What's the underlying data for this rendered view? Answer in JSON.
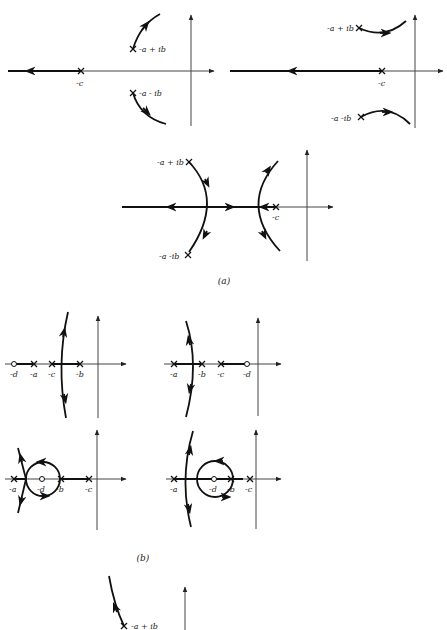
{
  "figure": {
    "captions": {
      "a": "(a)",
      "b": "(b)"
    },
    "part_a": {
      "plot1": {
        "labels": {
          "upper_pole": "-a + ib",
          "lower_pole": "-a - ib",
          "real_pole": "-c"
        }
      },
      "plot2": {
        "labels": {
          "upper_pole": "-a + ib",
          "lower_pole": "-a -ib",
          "real_pole": "-c"
        }
      },
      "plot3": {
        "labels": {
          "upper_pole": "-a + ib",
          "lower_pole": "-a -ib",
          "real_pole": "-c"
        }
      }
    },
    "part_b": {
      "plot1": {
        "labels": [
          "-d",
          "-a",
          "-c",
          "-b"
        ]
      },
      "plot2": {
        "labels": [
          "-a",
          "-b",
          "-c",
          "-d"
        ]
      },
      "plot3": {
        "labels": [
          "-a",
          "-d",
          "-b",
          "-c"
        ]
      },
      "plot4": {
        "labels": [
          "-a",
          "-d",
          "-b",
          "-c"
        ]
      }
    },
    "part_c": {
      "labels": {
        "upper_pole": "-a + ib"
      }
    }
  }
}
